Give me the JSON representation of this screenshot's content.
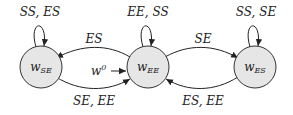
{
  "diagram": {
    "type": "state-machine",
    "node_fill": "#e6e6e6",
    "stroke": "#222222",
    "nodes": [
      {
        "id": "w_SE",
        "base": "w",
        "subscript": "SE",
        "cx": 41,
        "cy": 67
      },
      {
        "id": "w_EE",
        "base": "w",
        "subscript": "EE",
        "cx": 148,
        "cy": 67
      },
      {
        "id": "w_ES",
        "base": "w",
        "subscript": "ES",
        "cx": 255,
        "cy": 67
      }
    ],
    "self_loops": [
      {
        "node": "w_SE",
        "label": "SS, ES"
      },
      {
        "node": "w_EE",
        "label": "EE, SS"
      },
      {
        "node": "w_ES",
        "label": "SS, SE"
      }
    ],
    "edges": [
      {
        "from": "w_EE",
        "to": "w_SE",
        "label": "ES"
      },
      {
        "from": "w_SE",
        "to": "w_EE",
        "label": "SE, EE"
      },
      {
        "from": "w_EE",
        "to": "w_ES",
        "label": "SE"
      },
      {
        "from": "w_ES",
        "to": "w_EE",
        "label": "ES, EE"
      }
    ],
    "initial": {
      "node": "w_EE",
      "label_base": "w",
      "label_sup": "0"
    }
  }
}
